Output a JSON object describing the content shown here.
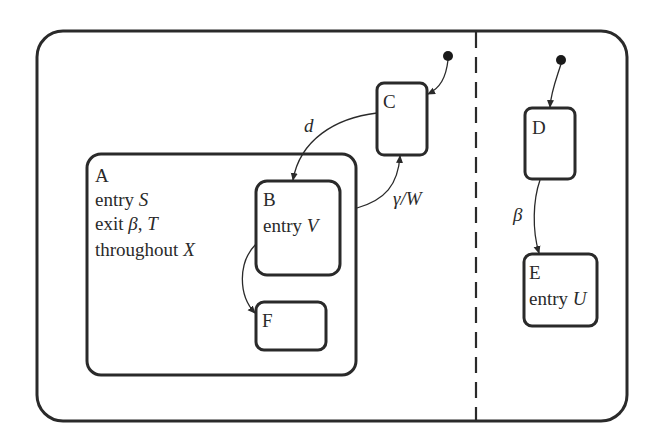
{
  "diagram": {
    "type": "statechart",
    "colors": {
      "stroke": "#2a2a2a",
      "background": "#ffffff"
    },
    "regions": [
      "left",
      "right"
    ],
    "states": {
      "A": {
        "name": "A",
        "entry_kw": "entry",
        "entry_action": "S",
        "exit_kw": "exit",
        "exit_action_1": "β",
        "exit_sep": ",",
        "exit_action_2": "T",
        "throughout_kw": "throughout",
        "throughout_action": "X"
      },
      "B": {
        "name": "B",
        "entry_kw": "entry",
        "entry_action": "V"
      },
      "C": {
        "name": "C"
      },
      "D": {
        "name": "D"
      },
      "E": {
        "name": "E",
        "entry_kw": "entry",
        "entry_action": "U"
      },
      "F": {
        "name": "F"
      }
    },
    "transitions": [
      {
        "from": "initial-left",
        "to": "C",
        "label": ""
      },
      {
        "from": "C",
        "to": "B",
        "label": "d"
      },
      {
        "from": "A",
        "to": "C",
        "label": "γ/W"
      },
      {
        "from": "B",
        "to": "F",
        "label": ""
      },
      {
        "from": "initial-right",
        "to": "D",
        "label": ""
      },
      {
        "from": "D",
        "to": "E",
        "label": "β"
      }
    ],
    "labels": {
      "d": "d",
      "gammaW": "γ/W",
      "beta": "β"
    }
  }
}
